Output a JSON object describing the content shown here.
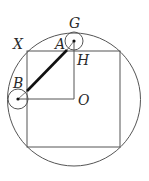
{
  "diagram": {
    "labels": {
      "G": "G",
      "X": "X",
      "A": "A",
      "H": "H",
      "B": "B",
      "O": "O"
    },
    "colors": {
      "stroke": "#555555",
      "thick": "#111111",
      "text": "#2a2a2a"
    },
    "geometry": {
      "big_circle": {
        "cx": 74,
        "cy": 99.5,
        "r": 66.5
      },
      "square": {
        "x": 27,
        "y": 51,
        "w": 93,
        "h": 96
      },
      "small_circle_top": {
        "cx": 74,
        "cy": 41,
        "r": 9
      },
      "small_circle_left": {
        "cx": 18,
        "cy": 99,
        "r": 10
      },
      "thick_segment": {
        "x1": 27,
        "y1": 91,
        "x2": 67,
        "y2": 50
      }
    }
  }
}
